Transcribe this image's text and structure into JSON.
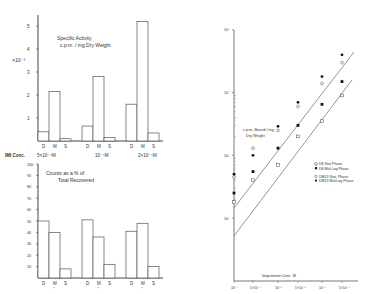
{
  "chart_data": [
    {
      "type": "bar",
      "title": "Specific Activity c.p.m./mg Dry Weight",
      "title_line1": "Specific Activity",
      "title_line2": "c.p.m. / mg Dry Weight",
      "ylabel": "×10⁻³",
      "yticks": [
        "1",
        "2",
        "3",
        "4",
        "5"
      ],
      "ylim": [
        0,
        5.5
      ],
      "bar_labels": [
        "D",
        "M",
        "S"
      ],
      "categories": [
        "5×10⁻⁶M",
        "10⁻⁵M",
        "2×10⁻⁵M"
      ],
      "series": [
        {
          "name": "D",
          "values": [
            0.4,
            0.65,
            1.6
          ]
        },
        {
          "name": "M",
          "values": [
            2.15,
            2.8,
            5.2
          ]
        },
        {
          "name": "S",
          "values": [
            0.1,
            0.15,
            0.35
          ]
        }
      ],
      "grid": false
    },
    {
      "type": "bar",
      "title": "Counts as a % of Total Recovered",
      "title_line1": "Counts as a % of",
      "title_line2": "Total Recovered",
      "xlabel": "IMI Conc.",
      "yticks": [
        "10",
        "20",
        "30",
        "40",
        "50",
        "60",
        "70",
        "80",
        "90",
        "100"
      ],
      "ylim": [
        0,
        100
      ],
      "bar_labels": [
        "D",
        "M",
        "S"
      ],
      "categories": [
        "5×10⁻⁶M",
        "10⁻⁵M",
        "2×10⁻⁵M"
      ],
      "series": [
        {
          "name": "D",
          "values": [
            50,
            51,
            41
          ]
        },
        {
          "name": "M",
          "values": [
            40,
            36,
            48
          ]
        },
        {
          "name": "S",
          "values": [
            8,
            12,
            10
          ]
        }
      ],
      "marker_under_M": "*",
      "grid": false
    },
    {
      "type": "scatter",
      "title": "c.p.m. Bound / mg Dry Weight",
      "inner_label_line1": "c.p.m. Bound / mg",
      "inner_label_line2": "Dry Weight",
      "xlabel": "Imipramine Conc. M",
      "xscale": "log",
      "yscale": "log",
      "xticks": [
        "10⁻⁷",
        "5×10⁻⁷",
        "10⁻⁶",
        "5×10⁻⁶",
        "10⁻⁵",
        "5×10⁻⁵"
      ],
      "yticks": [
        "10²",
        "10³",
        "10⁴",
        "10⁵"
      ],
      "ylim": [
        100,
        100000
      ],
      "legend": [
        {
          "label": "D8 Stat Phase",
          "marker": "open-square"
        },
        {
          "label": "D8 Mid Log Phase",
          "marker": "filled-square"
        },
        {
          "label": "DM13 Stat. Phase",
          "marker": "open-circle"
        },
        {
          "label": "DM13 Mid Log Phase",
          "marker": "filled-circle"
        }
      ],
      "legend_position": "right-middle",
      "series": [
        {
          "name": "D8 Stat Phase",
          "marker": "open-square",
          "x": [
            1e-07,
            5e-07,
            1e-06,
            5e-06,
            1e-05,
            5e-05
          ],
          "y": [
            180,
            400,
            700,
            2000,
            3500,
            9000
          ]
        },
        {
          "name": "D8 Mid Log Phase",
          "marker": "filled-square",
          "x": [
            1e-07,
            5e-07,
            1e-06,
            5e-06,
            1e-05,
            5e-05
          ],
          "y": [
            250,
            550,
            1300,
            3000,
            6500,
            15000
          ]
        },
        {
          "name": "DM13 Stat. Phase",
          "marker": "open-circle",
          "x": [
            1e-07,
            5e-07,
            1e-06,
            5e-06,
            1e-05,
            5e-05
          ],
          "y": [
            450,
            1300,
            2500,
            6000,
            14000,
            30000
          ]
        },
        {
          "name": "DM13 Mid Log Phase",
          "marker": "filled-circle",
          "x": [
            1e-07,
            5e-07,
            1e-06,
            5e-06,
            1e-05,
            5e-05
          ],
          "y": [
            500,
            1000,
            2900,
            7000,
            18000,
            40000
          ]
        }
      ],
      "fit_lines": 2,
      "grid": false
    }
  ],
  "labels": {
    "conc_label": "IMI Conc.",
    "conc_values": [
      "5×10⁻⁶M",
      "10⁻⁵M",
      "2×10⁻⁵M"
    ]
  }
}
